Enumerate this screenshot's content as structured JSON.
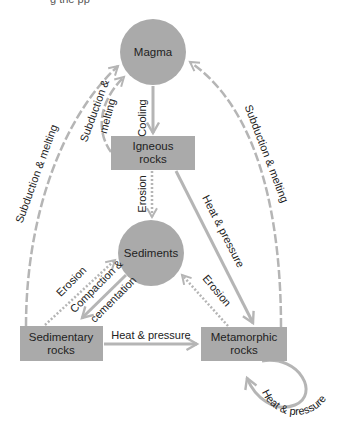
{
  "title_fragment": "g     the   pp",
  "colors": {
    "node_fill": "#aaaaaa",
    "arrow": "#b5b5b5",
    "text": "#222222",
    "background": "#ffffff"
  },
  "nodes": {
    "magma": {
      "label": "Magma",
      "shape": "circle"
    },
    "sediments": {
      "label": "Sediments",
      "shape": "circle"
    },
    "igneous": {
      "line1": "Igneous",
      "line2": "rocks",
      "shape": "rect"
    },
    "sedimentary": {
      "line1": "Sedimentary",
      "line2": "rocks",
      "shape": "rect"
    },
    "metamorphic": {
      "line1": "Metamorphic",
      "line2": "rocks",
      "shape": "rect"
    }
  },
  "edges": {
    "cooling": {
      "label": "Cooling",
      "from": "Magma",
      "to": "Igneous rocks",
      "style": "solid"
    },
    "igneous_subduction": {
      "line1": "Subduction &",
      "line2": "melting",
      "from": "Igneous rocks",
      "to": "Magma",
      "style": "dashed"
    },
    "sedimentary_subduction": {
      "label": "Subduction & melting",
      "from": "Sedimentary rocks",
      "to": "Magma",
      "style": "dashed"
    },
    "metamorphic_subduction": {
      "label": "Subduction & melting",
      "from": "Metamorphic rocks",
      "to": "Magma",
      "style": "dashed"
    },
    "igneous_erosion": {
      "label": "Erosion",
      "from": "Igneous rocks",
      "to": "Sediments",
      "style": "dotted"
    },
    "igneous_heat": {
      "label": "Heat & pressure",
      "from": "Igneous rocks",
      "to": "Metamorphic rocks",
      "style": "solid"
    },
    "sedimentary_erosion": {
      "label": "Erosion",
      "from": "Sedimentary rocks",
      "to": "Sediments",
      "style": "dotted"
    },
    "compaction": {
      "line1": "Compaction &",
      "line2": "cementation",
      "from": "Sediments",
      "to": "Sedimentary rocks",
      "style": "solid"
    },
    "metamorphic_erosion": {
      "label": "Erosion",
      "from": "Metamorphic rocks",
      "to": "Sediments",
      "style": "dotted"
    },
    "sedimentary_heat": {
      "label": "Heat & pressure",
      "from": "Sedimentary rocks",
      "to": "Metamorphic rocks",
      "style": "solid"
    },
    "metamorphic_loop": {
      "label": "Heat & pressure",
      "from": "Metamorphic rocks",
      "to": "Metamorphic rocks",
      "style": "solid"
    }
  }
}
